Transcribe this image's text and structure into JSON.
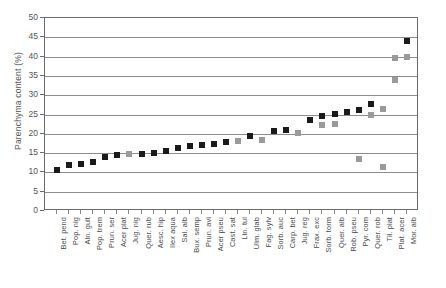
{
  "chart_data": {
    "type": "scatter",
    "title": "",
    "xlabel": "",
    "ylabel": "Parenchyma content (%)",
    "ylim": [
      0,
      50
    ],
    "ytick_step": 5,
    "yticks": [
      0,
      5,
      10,
      15,
      20,
      25,
      30,
      35,
      40,
      45,
      50
    ],
    "grid": true,
    "legend": "none",
    "marker": "square",
    "colors": {
      "black": "#1a1a1a",
      "gray": "#9a9a9a"
    },
    "categories": [
      "Bet. pend",
      "Pop. nig",
      "Aln. gult",
      "Pop. trem",
      "Prun. ser",
      "Acer plat",
      "Jug. nig",
      "Quer. rub",
      "Aesc. hip",
      "Ilex aqua",
      "Sal. alb",
      "Bux. semp",
      "Prun. avi",
      "Acer pseu",
      "Cast. sat",
      "Lin. tul",
      "Ulm. glab",
      "Fag. sylv",
      "Sorb. auc",
      "Carp. bet",
      "Jug. reg",
      "Frax. exc",
      "Sorb. torm",
      "Quer. alb",
      "Rob. pseu",
      "Pyr. com",
      "Quer. rob",
      "Til. plat",
      "Plat. acer",
      "Mor. alb"
    ],
    "series": [
      {
        "name": "black-markers",
        "color": "#1a1a1a",
        "points": [
          {
            "x": "Bet. pend",
            "y": 10.5
          },
          {
            "x": "Pop. nig",
            "y": 12.0
          },
          {
            "x": "Aln. gult",
            "y": 12.1
          },
          {
            "x": "Pop. trem",
            "y": 12.6
          },
          {
            "x": "Prun. ser",
            "y": 14.0
          },
          {
            "x": "Acer plat",
            "y": 14.6
          },
          {
            "x": "Quer. rub",
            "y": 14.8
          },
          {
            "x": "Aesc. hip",
            "y": 15.0
          },
          {
            "x": "Ilex aqua",
            "y": 15.5
          },
          {
            "x": "Sal. alb",
            "y": 16.4
          },
          {
            "x": "Bux. semp",
            "y": 16.8
          },
          {
            "x": "Prun. avi",
            "y": 17.2
          },
          {
            "x": "Acer pseu",
            "y": 17.4
          },
          {
            "x": "Cast. sat",
            "y": 18.0
          },
          {
            "x": "Ulm. glab",
            "y": 19.4
          },
          {
            "x": "Sorb. auc",
            "y": 20.8
          },
          {
            "x": "Carp. bet",
            "y": 21.0
          },
          {
            "x": "Frax. exc",
            "y": 23.6
          },
          {
            "x": "Sorb. torm",
            "y": 24.6
          },
          {
            "x": "Quer. alb",
            "y": 25.2
          },
          {
            "x": "Rob. pseu",
            "y": 25.6
          },
          {
            "x": "Pyr. com",
            "y": 26.2
          },
          {
            "x": "Quer. rob",
            "y": 27.8
          },
          {
            "x": "Mor. alb",
            "y": 44.0
          }
        ]
      },
      {
        "name": "gray-markers",
        "color": "#9a9a9a",
        "points": [
          {
            "x": "Jug. nig",
            "y": 14.8
          },
          {
            "x": "Lin. tul",
            "y": 18.2
          },
          {
            "x": "Fag. sylv",
            "y": 18.4
          },
          {
            "x": "Jug. reg",
            "y": 20.2
          },
          {
            "x": "Sorb. torm",
            "y": 22.4
          },
          {
            "x": "Quer. alb",
            "y": 22.6
          },
          {
            "x": "Pyr. com",
            "y": 13.4
          },
          {
            "x": "Quer. rob",
            "y": 25.0
          },
          {
            "x": "Til. plat",
            "y": 26.4
          },
          {
            "x": "Plat. acer",
            "y": 34.0
          },
          {
            "x": "Til. plat",
            "y": 11.4
          },
          {
            "x": "Plat. acer",
            "y": 39.6
          },
          {
            "x": "Mor. alb",
            "y": 39.9
          }
        ]
      }
    ]
  },
  "axis": {
    "y_title": "Parenchyma content (%)"
  }
}
